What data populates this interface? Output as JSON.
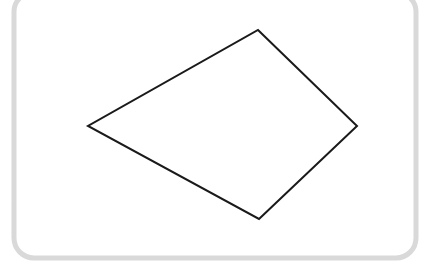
{
  "figure": {
    "canvas": {
      "width": 437,
      "height": 272,
      "background_color": "#ffffff"
    },
    "frame": {
      "name": "rounded-rectangle-border",
      "shape": "rounded-rectangle",
      "stroke_color": "#d9d9d9",
      "stroke_width": 5,
      "corner_radius": 20,
      "fill": "none",
      "x": 14,
      "y": -8,
      "width": 402,
      "height": 266,
      "note": "top edge clipped above canvas top"
    },
    "shapes": [
      {
        "name": "quadrilateral",
        "type": "polygon",
        "sides": 4,
        "description": "kite-like quadrilateral",
        "stroke_color": "#1a1a1a",
        "stroke_width": 2,
        "fill": "none",
        "points": "258,30 357,126 259,219 88,126",
        "vertices": [
          {
            "label": "top",
            "x": 258,
            "y": 30
          },
          {
            "label": "right",
            "x": 357,
            "y": 126
          },
          {
            "label": "bottom",
            "x": 259,
            "y": 219
          },
          {
            "label": "left",
            "x": 88,
            "y": 126
          }
        ]
      }
    ]
  }
}
